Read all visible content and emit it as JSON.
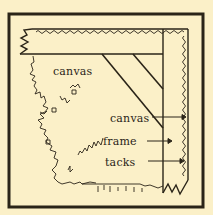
{
  "diagram": {
    "colors": {
      "background": "#fbf0c8",
      "ink": "#2a2418"
    },
    "labels": {
      "canvas_area": "canvas",
      "canvas_pointer": "canvas",
      "frame_pointer": "frame",
      "tacks_pointer": "tacks"
    }
  }
}
